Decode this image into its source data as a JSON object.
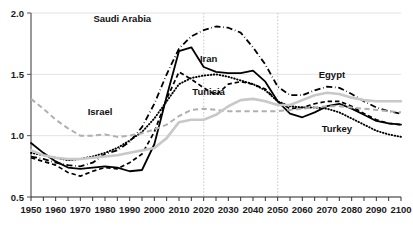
{
  "chart_data": {
    "type": "line",
    "title": "",
    "xlabel": "",
    "ylabel": "",
    "xlim": [
      1950,
      2100
    ],
    "ylim": [
      0.5,
      2.0
    ],
    "yticks": [
      0.5,
      1.0,
      1.5,
      2.0
    ],
    "ytick_labels": [
      "0.5",
      "1.0",
      "1.5",
      "2.0"
    ],
    "xticks": [
      1950,
      1955,
      1960,
      1965,
      1970,
      1975,
      1980,
      1985,
      1990,
      1995,
      2000,
      2005,
      2010,
      2015,
      2020,
      2025,
      2030,
      2035,
      2040,
      2045,
      2050,
      2055,
      2060,
      2065,
      2070,
      2075,
      2080,
      2085,
      2090,
      2095,
      2100
    ],
    "xtick_labels_major": [
      "1950",
      "1960",
      "1970",
      "1980",
      "1990",
      "2000",
      "2010",
      "2020",
      "2030",
      "2040",
      "2050",
      "2060",
      "2070",
      "2080",
      "2090",
      "2100"
    ],
    "xticks_major": [
      1950,
      1960,
      1970,
      1980,
      1990,
      2000,
      2010,
      2020,
      2030,
      2040,
      2050,
      2060,
      2070,
      2080,
      2090,
      2100
    ],
    "grid": "horizontal-gridlines-at-y-ticks",
    "vertical_markers": [
      2020,
      2050
    ],
    "legend_position": "inline-annotations",
    "x": [
      1950,
      1955,
      1960,
      1965,
      1970,
      1975,
      1980,
      1985,
      1990,
      1995,
      2000,
      2005,
      2010,
      2015,
      2020,
      2025,
      2030,
      2035,
      2040,
      2045,
      2050,
      2055,
      2060,
      2065,
      2070,
      2075,
      2080,
      2085,
      2090,
      2095,
      2100
    ],
    "series": [
      {
        "name": "Iran",
        "style": "solid",
        "color": "#000000",
        "width": 1.8,
        "label_x": 2022,
        "label_y": 1.6,
        "values": [
          0.94,
          0.86,
          0.79,
          0.74,
          0.73,
          0.74,
          0.75,
          0.74,
          0.71,
          0.72,
          0.93,
          1.32,
          1.69,
          1.72,
          1.56,
          1.52,
          1.51,
          1.51,
          1.53,
          1.44,
          1.28,
          1.18,
          1.15,
          1.19,
          1.24,
          1.26,
          1.22,
          1.17,
          1.12,
          1.1,
          1.09
        ]
      },
      {
        "name": "Tunisia",
        "style": "dashed",
        "color": "#000000",
        "width": 1.7,
        "label_x": 2022,
        "label_y": 1.33,
        "values": [
          0.82,
          0.79,
          0.76,
          0.7,
          0.67,
          0.71,
          0.74,
          0.73,
          0.78,
          0.85,
          1.03,
          1.3,
          1.52,
          1.46,
          1.39,
          1.33,
          1.42,
          1.44,
          1.42,
          1.38,
          1.28,
          1.22,
          1.23,
          1.26,
          1.28,
          1.28,
          1.24,
          1.18,
          1.13,
          1.1,
          1.09
        ]
      },
      {
        "name": "Turkey",
        "style": "dotted",
        "color": "#000000",
        "width": 1.9,
        "label_x": 2074,
        "label_y": 1.03,
        "values": [
          0.86,
          0.84,
          0.82,
          0.8,
          0.81,
          0.83,
          0.86,
          0.9,
          0.96,
          1.03,
          1.14,
          1.28,
          1.42,
          1.47,
          1.49,
          1.5,
          1.48,
          1.45,
          1.42,
          1.37,
          1.28,
          1.24,
          1.23,
          1.23,
          1.22,
          1.19,
          1.14,
          1.09,
          1.04,
          1.01,
          0.99
        ]
      },
      {
        "name": "Saudi Arabia",
        "style": "dashdot",
        "color": "#000000",
        "width": 1.8,
        "label_x": 1987,
        "label_y": 1.93,
        "values": [
          0.83,
          0.81,
          0.78,
          0.76,
          0.75,
          0.78,
          0.85,
          0.88,
          0.95,
          1.07,
          1.26,
          1.5,
          1.71,
          1.81,
          1.86,
          1.89,
          1.88,
          1.84,
          1.72,
          1.58,
          1.4,
          1.33,
          1.33,
          1.37,
          1.4,
          1.39,
          1.34,
          1.28,
          1.23,
          1.2,
          1.18
        ]
      },
      {
        "name": "Israel",
        "style": "dashed",
        "color": "#b0b0b0",
        "width": 2.0,
        "label_x": 1978,
        "label_y": 1.17,
        "values": [
          1.3,
          1.22,
          1.13,
          1.06,
          1.0,
          1.0,
          1.01,
          0.99,
          1.0,
          1.02,
          1.05,
          1.09,
          1.16,
          1.21,
          1.22,
          1.21,
          1.2,
          1.2,
          1.2,
          1.2,
          1.2,
          1.21,
          1.22,
          1.23,
          1.24,
          1.24,
          1.23,
          1.22,
          1.21,
          1.2,
          1.19
        ]
      },
      {
        "name": "Egypt",
        "style": "solid",
        "color": "#c8c8c8",
        "width": 2.6,
        "label_x": 2072,
        "label_y": 1.47,
        "values": [
          0.88,
          0.84,
          0.82,
          0.81,
          0.81,
          0.82,
          0.83,
          0.84,
          0.86,
          0.88,
          0.9,
          0.98,
          1.11,
          1.13,
          1.13,
          1.17,
          1.24,
          1.29,
          1.3,
          1.28,
          1.25,
          1.25,
          1.29,
          1.33,
          1.35,
          1.34,
          1.31,
          1.29,
          1.28,
          1.28,
          1.28
        ]
      }
    ]
  }
}
